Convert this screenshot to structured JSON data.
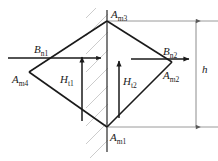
{
  "diagram": {
    "type": "vector-field-boundary-diagram",
    "shape": "rhombus",
    "vertices": [
      {
        "id": "top",
        "label_base": "A",
        "label_sub": "m3",
        "x": 107,
        "y": 21
      },
      {
        "id": "right",
        "label_base": "A",
        "label_sub": "m2",
        "x": 172,
        "y": 62
      },
      {
        "id": "bottom",
        "label_base": "A",
        "label_sub": "m1",
        "x": 107,
        "y": 127
      },
      {
        "id": "left",
        "label_base": "A",
        "label_sub": "m4",
        "x": 29,
        "y": 72
      }
    ],
    "vectors": [
      {
        "id": "Bn1",
        "label_base": "B",
        "label_sub": "n1",
        "orientation": "horizontal",
        "direction": "right"
      },
      {
        "id": "Bn2",
        "label_base": "B",
        "label_sub": "n2",
        "orientation": "horizontal",
        "direction": "right"
      },
      {
        "id": "Ht1",
        "label_base": "H",
        "label_sub": "t1",
        "orientation": "vertical",
        "direction": "up"
      },
      {
        "id": "Ht2",
        "label_base": "H",
        "label_sub": "t2",
        "orientation": "vertical",
        "direction": "up"
      }
    ],
    "dimension": {
      "id": "h",
      "label": "h",
      "orientation": "vertical",
      "from_y": 21,
      "to_y": 127
    },
    "boundary": {
      "id": "hatched-interface",
      "orientation": "vertical",
      "x": 107,
      "hatching": "diagonal"
    },
    "colors": {
      "line": "#1a1a1a",
      "hatch": "#c9c9c9",
      "dimension": "#8c8c8c",
      "background": "#ffffff"
    }
  },
  "labels": {
    "Am3": {
      "base": "A",
      "sub": "m3"
    },
    "Am2": {
      "base": "A",
      "sub": "m2"
    },
    "Am1": {
      "base": "A",
      "sub": "m1"
    },
    "Am4": {
      "base": "A",
      "sub": "m4"
    },
    "Bn1": {
      "base": "B",
      "sub": "n1"
    },
    "Bn2": {
      "base": "B",
      "sub": "n2"
    },
    "Ht1": {
      "base": "H",
      "sub": "t1"
    },
    "Ht2": {
      "base": "H",
      "sub": "t2"
    },
    "h": {
      "text": "h"
    }
  }
}
